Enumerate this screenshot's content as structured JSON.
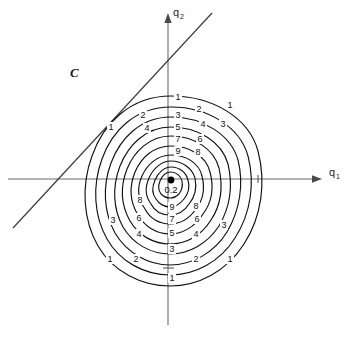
{
  "figure": {
    "title": "",
    "background_color": "#ffffff",
    "axis_color": "#6b6b6b",
    "contour_color": "#111111",
    "text_color": "#1a1a1a",
    "width": 350,
    "height": 341
  },
  "axes": {
    "x": {
      "label": "q",
      "subscript": "1",
      "name": "q1-axis"
    },
    "y": {
      "label": "q",
      "subscript": "2",
      "name": "q2-axis"
    }
  },
  "annotations": {
    "region": "C",
    "center_value": "0.2",
    "center_point": "minimum"
  },
  "chart_data": {
    "type": "contour",
    "title": "",
    "xlabel": "q1",
    "ylabel": "q2",
    "grid": false,
    "legend": "none",
    "origin_marker": "filled-dot",
    "center_level": "0.2",
    "levels": [
      1,
      2,
      3,
      4,
      5,
      6,
      7,
      8,
      9
    ],
    "level_labels_top": [
      "1",
      "2",
      "3",
      "4",
      "5",
      "6",
      "7",
      "8",
      "9"
    ],
    "level_labels_bottom": [
      "9",
      "8",
      "7",
      "6",
      "5",
      "4",
      "3",
      "2",
      "1"
    ],
    "diagonal_line": {
      "present": true,
      "description": "straight line through second quadrant",
      "x1": 13,
      "y1": 228,
      "x2": 212,
      "y2": 13
    },
    "contour_labels": [
      {
        "text": "1",
        "x": 178,
        "y": 100
      },
      {
        "text": "2",
        "x": 199,
        "y": 112
      },
      {
        "text": "1",
        "x": 230,
        "y": 108
      },
      {
        "text": "2",
        "x": 143,
        "y": 118
      },
      {
        "text": "3",
        "x": 178,
        "y": 118
      },
      {
        "text": "4",
        "x": 203,
        "y": 127
      },
      {
        "text": "1",
        "x": 111,
        "y": 130
      },
      {
        "text": "4",
        "x": 147,
        "y": 131
      },
      {
        "text": "5",
        "x": 178,
        "y": 130
      },
      {
        "text": "3",
        "x": 223,
        "y": 127
      },
      {
        "text": "7",
        "x": 178,
        "y": 142
      },
      {
        "text": "6",
        "x": 200,
        "y": 142
      },
      {
        "text": "9",
        "x": 178,
        "y": 154
      },
      {
        "text": "8",
        "x": 198,
        "y": 155
      },
      {
        "text": "0.2",
        "x": 171,
        "y": 191
      },
      {
        "text": "8",
        "x": 140,
        "y": 203
      },
      {
        "text": "9",
        "x": 172,
        "y": 210
      },
      {
        "text": "8",
        "x": 196,
        "y": 209
      },
      {
        "text": "6",
        "x": 139,
        "y": 221
      },
      {
        "text": "7",
        "x": 172,
        "y": 222
      },
      {
        "text": "6",
        "x": 197,
        "y": 222
      },
      {
        "text": "3",
        "x": 113,
        "y": 223
      },
      {
        "text": "4",
        "x": 139,
        "y": 237
      },
      {
        "text": "5",
        "x": 172,
        "y": 236
      },
      {
        "text": "4",
        "x": 196,
        "y": 237
      },
      {
        "text": "3",
        "x": 224,
        "y": 228
      },
      {
        "text": "3",
        "x": 172,
        "y": 252
      },
      {
        "text": "2",
        "x": 136,
        "y": 262
      },
      {
        "text": "2",
        "x": 196,
        "y": 262
      },
      {
        "text": "1",
        "x": 110,
        "y": 262
      },
      {
        "text": "1",
        "x": 230,
        "y": 262
      },
      {
        "text": "1",
        "x": 172,
        "y": 281
      }
    ]
  }
}
